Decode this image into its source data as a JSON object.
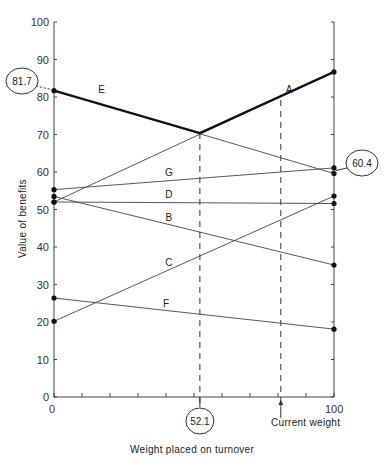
{
  "chart_data": {
    "type": "line",
    "title": "",
    "xlabel": "Weight placed on turnover",
    "ylabel": "Value of benefits",
    "xlim": [
      0,
      100
    ],
    "ylim": [
      0,
      100
    ],
    "x_ticks": [
      0,
      10,
      20,
      30,
      40,
      50,
      60,
      70,
      80,
      90,
      100
    ],
    "x_tick_labels": {
      "0": "0",
      "100": "100"
    },
    "y_ticks": [
      0,
      10,
      20,
      30,
      40,
      50,
      60,
      70,
      80,
      90,
      100
    ],
    "y_tick_labels": [
      "0",
      "10",
      "20",
      "30",
      "40",
      "50",
      "60",
      "70",
      "80",
      "90",
      "100"
    ],
    "grid": false,
    "legend": "none (lines labeled inline)",
    "series": [
      {
        "name": "A",
        "x": [
          0,
          100
        ],
        "values": [
          52.0,
          86.7
        ],
        "label_pos": [
          84,
          81
        ]
      },
      {
        "name": "B",
        "x": [
          0,
          100
        ],
        "values": [
          53.5,
          35.2
        ],
        "label_pos": [
          41,
          47
        ]
      },
      {
        "name": "C",
        "x": [
          0,
          100
        ],
        "values": [
          20.2,
          53.6
        ],
        "label_pos": [
          41,
          35
        ]
      },
      {
        "name": "D",
        "x": [
          0,
          100
        ],
        "values": [
          52.0,
          51.6
        ],
        "label_pos": [
          41,
          53
        ]
      },
      {
        "name": "E",
        "x": [
          0,
          100
        ],
        "values": [
          81.7,
          59.6
        ],
        "label_pos": [
          17,
          81
        ]
      },
      {
        "name": "F",
        "x": [
          0,
          100
        ],
        "values": [
          26.4,
          18.1
        ],
        "label_pos": [
          40,
          24
        ]
      },
      {
        "name": "G",
        "x": [
          0,
          100
        ],
        "values": [
          55.3,
          61.1
        ],
        "label_pos": [
          41,
          59
        ]
      }
    ],
    "upper_envelope": {
      "x": [
        0,
        52.1,
        100
      ],
      "values": [
        81.7,
        70.4,
        86.7
      ]
    },
    "annotations": [
      {
        "type": "circled_value",
        "text": "81.7",
        "x": 0,
        "y": 81.7,
        "side": "left"
      },
      {
        "type": "circled_value",
        "text": "60.4",
        "x": 100,
        "y": 60.4,
        "side": "right"
      },
      {
        "type": "circled_value",
        "text": "52.1",
        "x": 52.1,
        "y": 0,
        "side": "bottom"
      },
      {
        "type": "vertical_dashed",
        "x": 52.1,
        "from": 0,
        "to": 70.4
      },
      {
        "type": "vertical_dashed",
        "x": 81,
        "from": 0,
        "to": 80.6
      },
      {
        "type": "arrow_label",
        "text": "Current weight",
        "x": 81
      }
    ]
  },
  "labels": {
    "xlabel": "Weight placed on turnover",
    "ylabel": "Value of benefits",
    "x0": "0",
    "x100": "100",
    "y0_outer": "0",
    "current_weight": "Current weight",
    "circ_left": "81.7",
    "circ_right": "60.4",
    "circ_bottom": "52.1"
  }
}
